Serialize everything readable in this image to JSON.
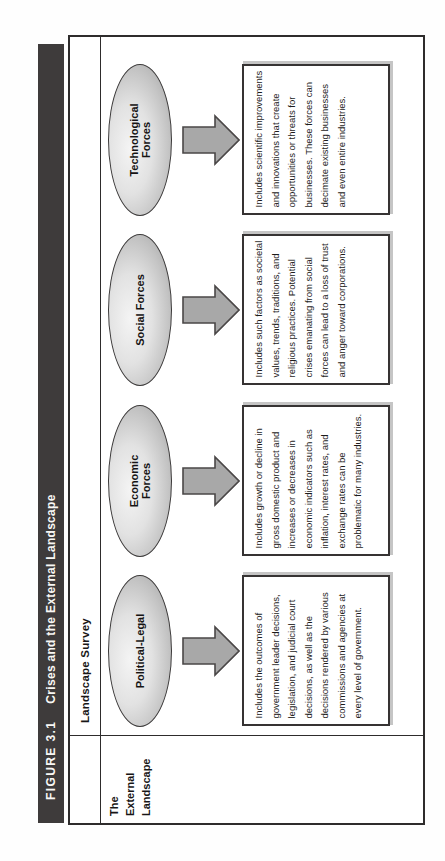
{
  "figure": {
    "label": "FIGURE 3.1",
    "title": "Crises and the External Landscape"
  },
  "survey_header": "Landscape Survey",
  "row_label": "The\nExternal\nLandscape",
  "forces": [
    {
      "name": "Political-Legal",
      "description": "Includes the outcomes of government leader decisions, legislation, and judicial court decisions, as well as the decisions rendered by various commissions and agencies at every level of government."
    },
    {
      "name": "Economic\nForces",
      "description": "Includes growth or decline in gross domestic product and increases or decreases in economic indicators such as inflation, interest rates, and exchange rates can be problematic for many industries."
    },
    {
      "name": "Social Forces",
      "description": "Includes such factors as societal values, trends, traditions, and religious practices. Potential crises emanating from social forces can lead to a loss of trust and anger toward corporations."
    },
    {
      "name": "Technological\nForces",
      "description": "Includes scientific improvements and innovations that create opportunities or threats for businesses. These forces can decimate existing businesses and even entire industries."
    }
  ],
  "colors": {
    "title_bar_bg": "#3e3b3b",
    "title_bar_text": "#f8f7f4",
    "table_border": "#2e2c2c",
    "ellipse_edge": "#9d9d9d",
    "ellipse_center": "#f4f4f4",
    "arrow_fill": "#a8a8a8",
    "arrow_outline": "#4a4747"
  },
  "orientation_note": "page rotated 90 degrees counterclockwise"
}
